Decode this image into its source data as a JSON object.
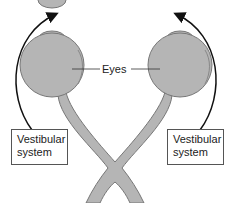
{
  "diagram": {
    "labels": {
      "eyes": "Eyes",
      "left_box_line1": "Vestibular",
      "left_box_line2": "system",
      "right_box_line1": "Vestibular",
      "right_box_line2": "system"
    },
    "colors": {
      "eye_fill": "#b5b5b5",
      "eye_stroke": "#777777",
      "arrow": "#111111",
      "box_border": "#555555"
    }
  }
}
